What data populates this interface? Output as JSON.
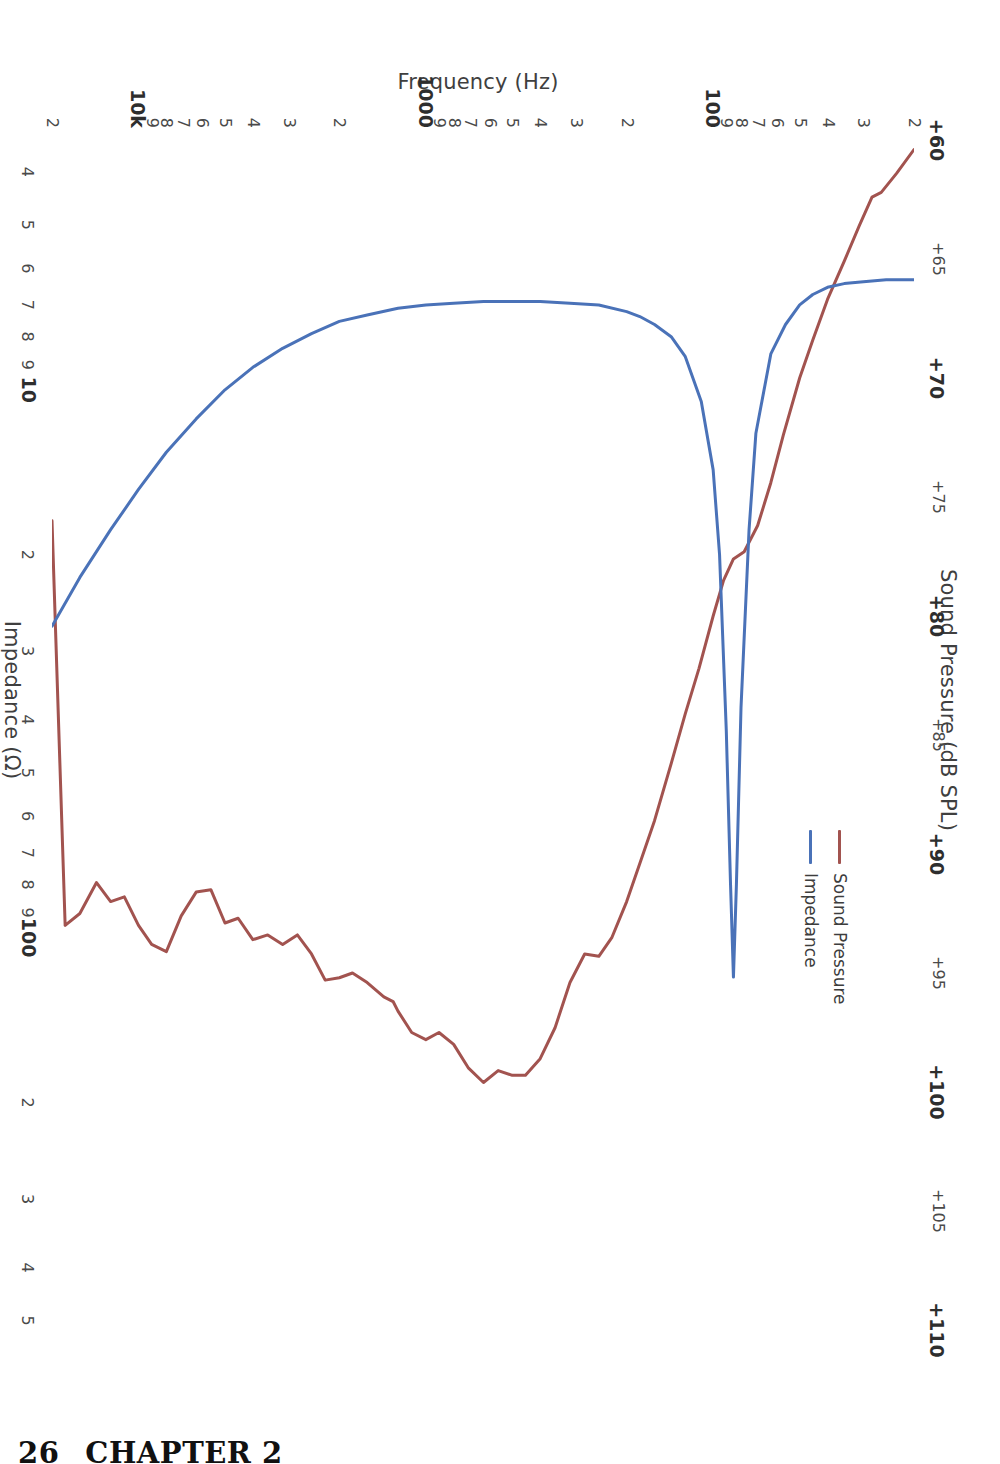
{
  "page": {
    "footer_page_number": "26",
    "footer_chapter": "CHAPTER 2"
  },
  "colors": {
    "sound_pressure": "#a2534f",
    "impedance": "#4a72b8",
    "text": "#3f3f3f",
    "background": "#ffffff"
  },
  "legend": {
    "position": "top-right",
    "entries": [
      {
        "label": "Sound Pressure",
        "color": "#a2534f"
      },
      {
        "label": "Impedance",
        "color": "#4a72b8"
      }
    ]
  },
  "axes": {
    "top": {
      "title": "Sound Pressure (dB SPL)",
      "scale": "linear",
      "min": 60,
      "max": 110,
      "ticks": [
        "+60",
        "+65",
        "+70",
        "+75",
        "+80",
        "+85",
        "+90",
        "+95",
        "+100",
        "+105",
        "+110"
      ]
    },
    "bottom": {
      "title": "Impedance (Ω)",
      "scale": "log",
      "min": 3.5,
      "max": 520,
      "ticks": [
        "4",
        "5",
        "6",
        "7",
        "8",
        "9",
        "10",
        "2",
        "3",
        "4",
        "5",
        "6",
        "7",
        "8",
        "9",
        "100",
        "2",
        "3",
        "4",
        "5"
      ]
    },
    "left": {
      "title": "Frequency (Hz)",
      "scale": "log",
      "min": 20,
      "max": 20000,
      "ticks": [
        "2",
        "3",
        "4",
        "5",
        "6",
        "7",
        "8",
        "9",
        "100",
        "2",
        "3",
        "4",
        "5",
        "6",
        "7",
        "8",
        "9",
        "1000",
        "2",
        "3",
        "4",
        "5",
        "6",
        "7",
        "8",
        "9",
        "10k",
        "2"
      ]
    }
  },
  "chart_data": {
    "type": "line",
    "title": "Sound Pressure (dB SPL)",
    "xlabel": "Frequency (Hz)",
    "ylabel": "Sound Pressure (dB SPL)",
    "y2label": "Impedance (Ω)",
    "xscale": "log",
    "yscale": "linear",
    "y2scale": "log",
    "xlim": [
      20,
      20000
    ],
    "ylim": [
      60,
      110
    ],
    "y2lim": [
      3.5,
      520
    ],
    "grid": false,
    "legend_position": "top-right",
    "orientation": "rotated-90-clockwise",
    "series": [
      {
        "name": "Sound Pressure",
        "color": "#a2534f",
        "unit": "dB SPL",
        "axis": "top",
        "x": [
          20,
          23,
          26,
          28,
          31,
          35,
          40,
          45,
          50,
          57,
          63,
          70,
          78,
          85,
          92,
          100,
          112,
          125,
          140,
          160,
          180,
          200,
          225,
          250,
          280,
          315,
          355,
          400,
          450,
          500,
          560,
          630,
          710,
          800,
          900,
          1000,
          1120,
          1250,
          1300,
          1400,
          1600,
          1800,
          2000,
          2240,
          2500,
          2800,
          3150,
          3550,
          4000,
          4500,
          5000,
          5600,
          6300,
          7100,
          8000,
          9000,
          10000,
          11200,
          12500,
          14000,
          16000,
          18000,
          20000
        ],
        "y": [
          60.4,
          61.4,
          62.2,
          62.4,
          63.6,
          65.1,
          66.7,
          68.4,
          70.0,
          72.4,
          74.4,
          76.2,
          77.3,
          77.6,
          78.5,
          80.0,
          82.2,
          84.1,
          86.2,
          88.6,
          90.4,
          92.0,
          93.5,
          94.3,
          94.2,
          95.4,
          97.3,
          98.6,
          99.3,
          99.3,
          99.1,
          99.6,
          99.0,
          98.0,
          97.5,
          97.8,
          97.5,
          96.6,
          96.2,
          96.0,
          95.4,
          95.0,
          95.2,
          95.3,
          94.2,
          93.4,
          93.8,
          93.4,
          93.6,
          92.7,
          92.9,
          91.5,
          91.6,
          92.6,
          94.1,
          93.8,
          93.0,
          91.8,
          92.0,
          91.2,
          92.5,
          93.0,
          76.0
        ],
        "notes": "Broad rise from 60 dB at 20 Hz to ~99 dB plateau from 400 Hz to 1 kHz; gentle ripples through midrange; dip near 6.3 kHz; peaks near 8 kHz and 16-18 kHz; sharp roll-off above 18 kHz."
      },
      {
        "name": "Impedance",
        "color": "#4a72b8",
        "unit": "ohm",
        "axis": "bottom",
        "x": [
          20,
          25,
          30,
          35,
          40,
          45,
          50,
          56,
          63,
          71,
          75,
          80,
          83,
          85,
          87,
          90,
          95,
          100,
          110,
          125,
          140,
          160,
          180,
          200,
          250,
          315,
          400,
          500,
          630,
          800,
          1000,
          1250,
          1600,
          2000,
          2500,
          3150,
          4000,
          5000,
          6300,
          8000,
          10000,
          12500,
          16000,
          20000
        ],
        "y": [
          6.3,
          6.3,
          6.35,
          6.4,
          6.5,
          6.7,
          7.0,
          7.6,
          8.6,
          12.0,
          18.0,
          38.0,
          80.0,
          118.0,
          80.0,
          42.0,
          20.0,
          14.0,
          10.5,
          8.7,
          8.0,
          7.6,
          7.35,
          7.2,
          7.0,
          6.95,
          6.9,
          6.9,
          6.9,
          6.95,
          7.0,
          7.1,
          7.3,
          7.5,
          7.9,
          8.4,
          9.1,
          10.0,
          11.3,
          13.0,
          15.2,
          18.0,
          22.0,
          27.0
        ],
        "notes": "Low-frequency fundamental resonance peak of ~118 ohm at ~85 Hz; minimum ~6.9 ohm across 400 Hz - 1 kHz; steady rise above 2 kHz due to voice-coil inductance reaching ~27 ohm at 20 kHz."
      }
    ]
  }
}
